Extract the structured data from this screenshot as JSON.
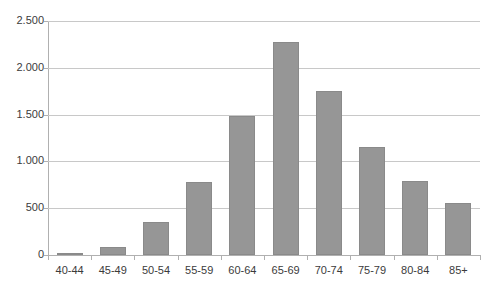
{
  "chart_data": {
    "type": "bar",
    "title": "",
    "subtitle": "",
    "xlabel": "",
    "ylabel": "",
    "categories": [
      "40-44",
      "45-49",
      "50-54",
      "55-59",
      "60-64",
      "65-69",
      "70-74",
      "75-79",
      "80-84",
      "85+"
    ],
    "values": [
      15,
      85,
      350,
      780,
      1485,
      2275,
      1750,
      1150,
      790,
      560
    ],
    "series": [
      {
        "name": "",
        "values": [
          15,
          85,
          350,
          780,
          1485,
          2275,
          1750,
          1150,
          790,
          560
        ]
      }
    ],
    "ylim": [
      0,
      2500
    ],
    "y_ticks": [
      0,
      500,
      1000,
      1500,
      2000,
      2500
    ],
    "y_tick_labels": [
      "0",
      "500",
      "1.000",
      "1.500",
      "2.000",
      "2.500"
    ],
    "grid": true,
    "legend": false,
    "legend_position": "none",
    "bar_color": "#969696",
    "grid_color": "#c8c8c8",
    "axis_color": "#b0b0b0",
    "text_color": "#3b3b3b"
  }
}
